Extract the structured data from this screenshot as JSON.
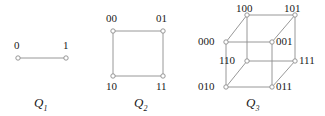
{
  "figure": {
    "background_color": "#ffffff",
    "edge_color": "#8c8c8c",
    "vertex_stroke_color": "#8c8c8c",
    "vertex_fill_color": "#ffffff",
    "label_color": "#1a1a1a"
  },
  "graphs": [
    {
      "name_letter": "Q",
      "name_sub": "1",
      "name_pos": {
        "x": 34,
        "y": 96
      },
      "vertices": [
        {
          "id": "0",
          "label": "0",
          "x": 18,
          "y": 58,
          "label_x": 14,
          "label_y": 40
        },
        {
          "id": "1",
          "label": "1",
          "x": 66,
          "y": 58,
          "label_x": 63,
          "label_y": 40
        }
      ],
      "edges": [
        [
          "0",
          "1"
        ]
      ]
    },
    {
      "name_letter": "Q",
      "name_sub": "2",
      "name_pos": {
        "x": 134,
        "y": 96
      },
      "vertices": [
        {
          "id": "00",
          "label": "00",
          "x": 113,
          "y": 31,
          "label_x": 106,
          "label_y": 13
        },
        {
          "id": "01",
          "label": "01",
          "x": 163,
          "y": 31,
          "label_x": 156,
          "label_y": 13
        },
        {
          "id": "10",
          "label": "10",
          "x": 113,
          "y": 76,
          "label_x": 106,
          "label_y": 81
        },
        {
          "id": "11",
          "label": "11",
          "x": 163,
          "y": 76,
          "label_x": 156,
          "label_y": 81
        }
      ],
      "edges": [
        [
          "00",
          "01"
        ],
        [
          "00",
          "10"
        ],
        [
          "01",
          "11"
        ],
        [
          "10",
          "11"
        ]
      ]
    },
    {
      "name_letter": "Q",
      "name_sub": "3",
      "name_pos": {
        "x": 246,
        "y": 96
      },
      "vertices": [
        {
          "id": "100",
          "label": "100",
          "x": 247,
          "y": 15,
          "label_x": 236,
          "label_y": 3
        },
        {
          "id": "101",
          "label": "101",
          "x": 295,
          "y": 15,
          "label_x": 284,
          "label_y": 3
        },
        {
          "id": "000",
          "label": "000",
          "x": 226,
          "y": 42,
          "label_x": 198,
          "label_y": 36
        },
        {
          "id": "001",
          "label": "001",
          "x": 272,
          "y": 42,
          "label_x": 276,
          "label_y": 36
        },
        {
          "id": "110",
          "label": "110",
          "x": 247,
          "y": 61,
          "label_x": 219,
          "label_y": 55
        },
        {
          "id": "111",
          "label": "111",
          "x": 295,
          "y": 61,
          "label_x": 299,
          "label_y": 55
        },
        {
          "id": "010",
          "label": "010",
          "x": 226,
          "y": 87,
          "label_x": 198,
          "label_y": 81
        },
        {
          "id": "011",
          "label": "011",
          "x": 272,
          "y": 87,
          "label_x": 276,
          "label_y": 81
        }
      ],
      "edges": [
        [
          "100",
          "101"
        ],
        [
          "100",
          "000"
        ],
        [
          "100",
          "110"
        ],
        [
          "101",
          "001"
        ],
        [
          "101",
          "111"
        ],
        [
          "000",
          "001"
        ],
        [
          "000",
          "010"
        ],
        [
          "001",
          "011"
        ],
        [
          "110",
          "111"
        ],
        [
          "110",
          "010"
        ],
        [
          "111",
          "011"
        ],
        [
          "010",
          "011"
        ]
      ]
    }
  ]
}
